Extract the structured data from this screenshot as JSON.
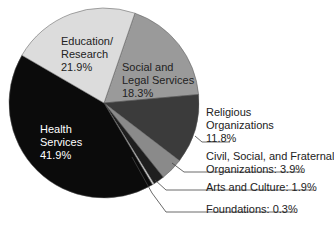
{
  "chart_data": {
    "type": "pie",
    "title": "",
    "start_angle_deg": 19,
    "direction": "clockwise",
    "slices": [
      {
        "name": "Social and Legal Services",
        "value": 18.3,
        "color": "#9a9a9a"
      },
      {
        "name": "Religious Organizations",
        "value": 11.8,
        "color": "#3b3b3b"
      },
      {
        "name": "Civil, Social, and Fraternal Organizations",
        "value": 3.9,
        "color": "#8a8a8a"
      },
      {
        "name": "Arts and Culture",
        "value": 1.9,
        "color": "#1f1f1f"
      },
      {
        "name": "Foundations",
        "value": 0.3,
        "color": "#d8d8d8"
      },
      {
        "name": "Health Services",
        "value": 41.9,
        "color": "#0b0b0b"
      },
      {
        "name": "Education/ Research",
        "value": 21.9,
        "color": "#dcdcdc"
      }
    ],
    "legend": "none (direct labels)"
  },
  "labels": {
    "education": {
      "line1": "Education/",
      "line2": "Research",
      "pct": "21.9%"
    },
    "social": {
      "line1": "Social and",
      "line2": "Legal Services",
      "pct": "18.3%"
    },
    "religious": {
      "line1": "Religious",
      "line2": "Organizations",
      "pct": "11.8%"
    },
    "civil": {
      "line1": "Civil, Social, and Fraternal",
      "line2": "Organizations: 3.9%"
    },
    "arts": {
      "line1": "Arts and Culture: 1.9%"
    },
    "foundations": {
      "line1": "Foundations: 0.3%"
    },
    "health": {
      "line1": "Health",
      "line2": "Services",
      "pct": "41.9%"
    }
  }
}
